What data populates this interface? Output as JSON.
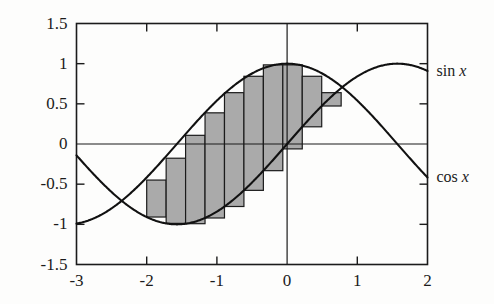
{
  "chart_data": {
    "type": "line",
    "title": "",
    "xlabel": "",
    "ylabel": "",
    "xlim": [
      -3,
      2
    ],
    "ylim": [
      -1.5,
      1.5
    ],
    "grid": false,
    "legend_position": "right-outside",
    "x_ticks": [
      "-3",
      "-2",
      "-1",
      "0",
      "1",
      "2"
    ],
    "x_tick_values": [
      -3,
      -2,
      -1,
      0,
      1,
      2
    ],
    "y_ticks": [
      "1.5",
      "1",
      "0.5",
      "0",
      "-0.5",
      "-1",
      "-1.5"
    ],
    "y_tick_values": [
      1.5,
      1,
      0.5,
      0,
      -0.5,
      -1,
      -1.5
    ],
    "series": [
      {
        "name": "sin x",
        "label": "sin x",
        "color": "#111111",
        "function": "sin",
        "x": [
          -3,
          -2.75,
          -2.5,
          -2.25,
          -2,
          -1.75,
          -1.5,
          -1.25,
          -1,
          -0.75,
          -0.5,
          -0.25,
          0,
          0.25,
          0.5,
          0.75,
          1,
          1.25,
          1.5,
          1.75,
          2
        ],
        "values": [
          -0.141,
          -0.382,
          -0.599,
          -0.778,
          -0.909,
          -0.984,
          -0.997,
          -0.949,
          -0.841,
          -0.682,
          -0.479,
          -0.247,
          0,
          0.247,
          0.479,
          0.682,
          0.841,
          0.949,
          0.997,
          0.984,
          0.909
        ]
      },
      {
        "name": "cos x",
        "label": "cos x",
        "color": "#111111",
        "function": "cos",
        "x": [
          -3,
          -2.75,
          -2.5,
          -2.25,
          -2,
          -1.75,
          -1.5,
          -1.25,
          -1,
          -0.75,
          -0.5,
          -0.25,
          0,
          0.25,
          0.5,
          0.75,
          1,
          1.25,
          1.5,
          1.75,
          2
        ],
        "values": [
          -0.99,
          -0.924,
          -0.801,
          -0.628,
          -0.416,
          -0.178,
          0.071,
          0.315,
          0.54,
          0.732,
          0.878,
          0.969,
          1.0,
          0.969,
          0.878,
          0.732,
          0.54,
          0.315,
          0.071,
          -0.178,
          -0.416
        ]
      }
    ],
    "rectangles": {
      "name": "riemann-rectangles",
      "fill": "#aaaaaa",
      "stroke": "#1b1b1b",
      "description": "Shaded rectangles between consecutive sin values from x=-2 to x=0.77",
      "edges": [
        -2.0,
        -1.723,
        -1.446,
        -1.169,
        -0.892,
        -0.615,
        -0.338,
        -0.061,
        0.216,
        0.493,
        0.77
      ],
      "tops": [
        -0.699,
        -0.449,
        -0.177,
        0.108,
        0.388,
        0.639,
        0.843,
        0.985,
        0.985,
        0.843,
        0.639
      ],
      "bottoms": [
        -0.909,
        -0.988,
        -0.992,
        -0.921,
        -0.778,
        -0.577,
        -0.332,
        -0.061,
        0.214,
        0.473,
        0.696
      ]
    }
  },
  "labels": {
    "sin_label": "sin",
    "cos_label": "cos",
    "variable": "x"
  }
}
